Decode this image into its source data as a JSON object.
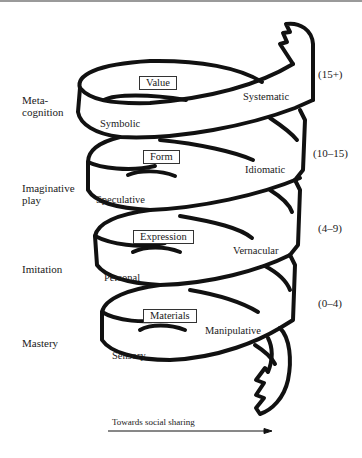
{
  "diagram": {
    "type": "spiral model",
    "stages": [
      {
        "name": "Meta-\ncognition",
        "age": "(15+)",
        "box": "Value",
        "left_mode": "Symbolic",
        "right_mode": "Systematic"
      },
      {
        "name": "Imaginative\nplay",
        "age": "(10–15)",
        "box": "Form",
        "left_mode": "Speculative",
        "right_mode": "Idiomatic"
      },
      {
        "name": "Imitation",
        "age": "(4–9)",
        "box": "Expression",
        "left_mode": "Personal",
        "right_mode": "Vernacular"
      },
      {
        "name": "Mastery",
        "age": "(0–4)",
        "box": "Materials",
        "left_mode": "Sensory",
        "right_mode": "Manipulative"
      }
    ],
    "axis": {
      "label": "Towards social sharing",
      "direction": "right"
    },
    "colors": {
      "ink": "#111111",
      "background": "#ffffff",
      "top_rule": "#9a9a9a"
    }
  }
}
